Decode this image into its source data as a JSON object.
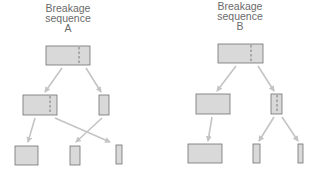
{
  "diagram": {
    "colors": {
      "box_fill": "#d9d9d9",
      "box_stroke": "#707070",
      "arrow": "#c4c4c4",
      "dashed": "#606060",
      "text": "#6a6a6a"
    },
    "sequences": [
      {
        "id": "A",
        "title_line1": "Breakage",
        "title_line2": "sequence",
        "title_line3": "A",
        "levels": [
          [
            "top fragment (break line marked)"
          ],
          [
            "large fragment (break line marked)",
            "small fragment"
          ],
          [
            "large piece",
            "medium piece",
            "small piece"
          ]
        ]
      },
      {
        "id": "B",
        "title_line1": "Breakage",
        "title_line2": "sequence",
        "title_line3": "B",
        "levels": [
          [
            "top fragment (break line marked)"
          ],
          [
            "large fragment",
            "small fragment (break line marked)"
          ],
          [
            "large piece",
            "medium piece",
            "small piece"
          ]
        ]
      }
    ]
  }
}
